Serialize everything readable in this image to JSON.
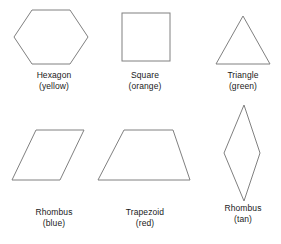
{
  "figure": {
    "type": "shape-chart",
    "background_color": "#ffffff",
    "stroke_color": "#808080",
    "text_color": "#1a1a1a",
    "rows": 2,
    "columns": 3
  },
  "shapes": [
    {
      "id": "hexagon",
      "name": "Hexagon",
      "color_label": "(yellow)",
      "color_word": "yellow",
      "sides": 6,
      "icon": "hexagon-outline-icon",
      "row": 1,
      "column": 1
    },
    {
      "id": "square",
      "name": "Square",
      "color_label": "(orange)",
      "color_word": "orange",
      "sides": 4,
      "icon": "square-outline-icon",
      "row": 1,
      "column": 2
    },
    {
      "id": "triangle",
      "name": "Triangle",
      "color_label": "(green)",
      "color_word": "green",
      "sides": 3,
      "icon": "triangle-outline-icon",
      "row": 1,
      "column": 3
    },
    {
      "id": "rhombus-blue",
      "name": "Rhombus",
      "color_label": "(blue)",
      "color_word": "blue",
      "sides": 4,
      "icon": "parallelogram-outline-icon",
      "row": 2,
      "column": 1
    },
    {
      "id": "trapezoid",
      "name": "Trapezoid",
      "color_label": "(red)",
      "color_word": "red",
      "sides": 4,
      "icon": "trapezoid-outline-icon",
      "row": 2,
      "column": 2
    },
    {
      "id": "rhombus-tan",
      "name": "Rhombus",
      "color_label": "(tan)",
      "color_word": "tan",
      "sides": 4,
      "icon": "narrow-diamond-outline-icon",
      "row": 2,
      "column": 3
    }
  ]
}
